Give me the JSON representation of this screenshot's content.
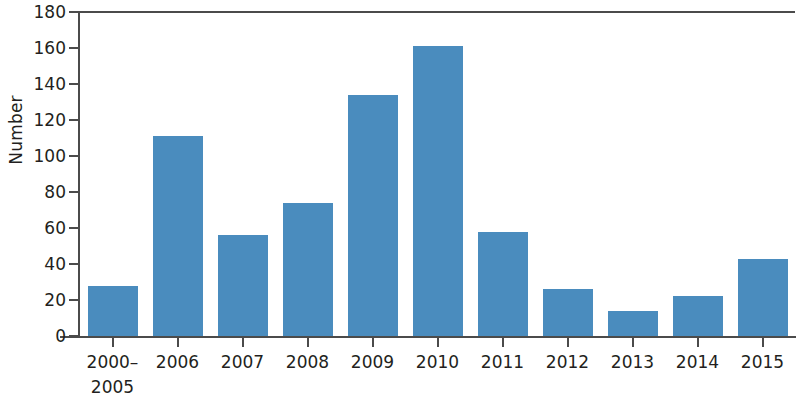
{
  "chart_data": {
    "type": "bar",
    "title": "",
    "subtitle": "",
    "xlabel": "",
    "ylabel": "Number",
    "categories": [
      "2000–\n2005",
      "2006",
      "2007",
      "2008",
      "2009",
      "2010",
      "2011",
      "2012",
      "2013",
      "2014",
      "2015"
    ],
    "values": [
      28,
      111,
      56,
      74,
      134,
      161,
      58,
      26,
      14,
      22,
      43
    ],
    "ylim": [
      0,
      180
    ],
    "ytick_values": [
      0,
      20,
      40,
      60,
      80,
      100,
      120,
      140,
      160,
      180
    ],
    "ytick_labels": [
      "0",
      "20",
      "40",
      "60",
      "80",
      "100",
      "120",
      "140",
      "160",
      "180"
    ],
    "grid": false,
    "legend": null,
    "legend_position": "none",
    "series": [
      {
        "name": "Number",
        "color": "#4a8cbe",
        "values": [
          28,
          111,
          56,
          74,
          134,
          161,
          58,
          26,
          14,
          22,
          43
        ]
      }
    ],
    "annotations": [],
    "colors": {
      "bar": "#4a8cbe",
      "axis": "#4b4b4b",
      "text": "#231f20",
      "background": "#ffffff"
    }
  }
}
